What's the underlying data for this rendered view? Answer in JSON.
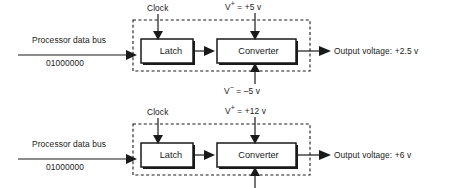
{
  "diagram": {
    "type": "block-diagram",
    "panels": [
      {
        "id": "panel-1",
        "clock_label": "Clock",
        "vpos_symbol": "V",
        "vpos_sign": "+",
        "vpos_value": "= +5 v",
        "vneg_symbol": "V",
        "vneg_sign": "−",
        "vneg_value": "= –5 v",
        "input_label": "Processor data bus",
        "input_value": "01000000",
        "blocks": [
          {
            "name": "latch",
            "label": "Latch"
          },
          {
            "name": "converter",
            "label": "Converter"
          }
        ],
        "output_label": "Output voltage: +2.5 v"
      },
      {
        "id": "panel-2",
        "clock_label": "Clock",
        "vpos_symbol": "V",
        "vpos_sign": "+",
        "vpos_value": "= +12 v",
        "vneg_symbol": "V",
        "vneg_sign": "−",
        "vneg_value": "= –12 v",
        "input_label": "Processor data bus",
        "input_value": "01000000",
        "blocks": [
          {
            "name": "latch",
            "label": "Latch"
          },
          {
            "name": "converter",
            "label": "Converter"
          }
        ],
        "output_label": "Output voltage: +6 v"
      }
    ],
    "colors": {
      "stroke": "#1a1a1a",
      "background": "#ffffff",
      "shadow": "#1a1a1a",
      "text": "#1a1a1a"
    }
  }
}
